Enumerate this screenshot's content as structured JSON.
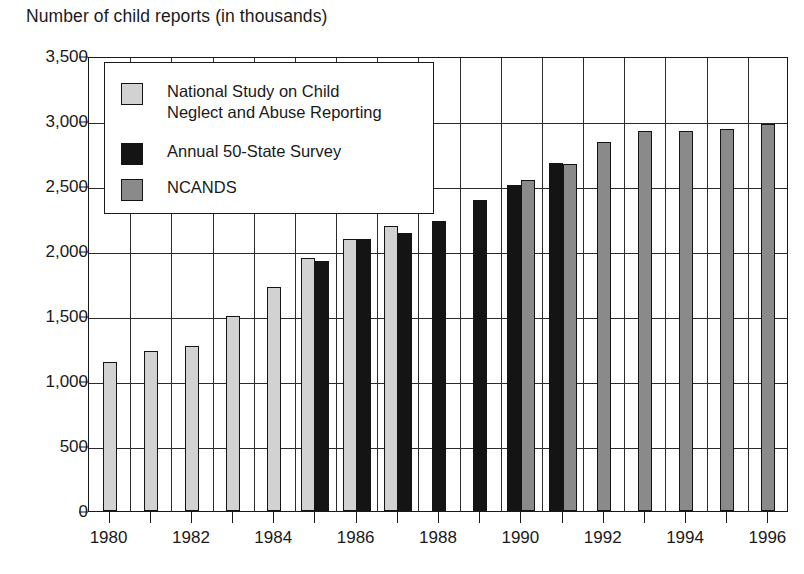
{
  "chart_data": {
    "type": "bar",
    "title": "Number of child reports (in thousands)",
    "xlabel": "",
    "ylabel": "",
    "ylim": [
      0,
      3500
    ],
    "ytick_step": 500,
    "grid": true,
    "legend_position": "upper-left-inside",
    "categories": [
      "1980",
      "1981",
      "1982",
      "1983",
      "1984",
      "1985",
      "1986",
      "1987",
      "1988",
      "1989",
      "1990",
      "1991",
      "1992",
      "1993",
      "1994",
      "1995",
      "1996"
    ],
    "x_tick_labels": [
      "1980",
      "1982",
      "1984",
      "1986",
      "1988",
      "1990",
      "1992",
      "1994",
      "1996"
    ],
    "y_tick_labels": [
      "0",
      "500",
      "1,000",
      "1,500",
      "2,000",
      "2,500",
      "3,000",
      "3,500"
    ],
    "y_tick_values": [
      0,
      500,
      1000,
      1500,
      2000,
      2500,
      3000,
      3500
    ],
    "series": [
      {
        "name": "National Study on Child Neglect and Abuse Reporting",
        "key": "national",
        "color": "#d2d2d2",
        "values": [
          1150,
          1230,
          1270,
          1500,
          1720,
          1950,
          2090,
          2190,
          null,
          null,
          null,
          null,
          null,
          null,
          null,
          null,
          null
        ]
      },
      {
        "name": "Annual 50-State Survey",
        "key": "annual",
        "color": "#141414",
        "values": [
          null,
          null,
          null,
          null,
          null,
          1920,
          2090,
          2140,
          2230,
          2390,
          2510,
          2680,
          null,
          null,
          null,
          null,
          null
        ]
      },
      {
        "name": "NCANDS",
        "key": "ncands",
        "color": "#8a8a8a",
        "values": [
          null,
          null,
          null,
          null,
          null,
          null,
          null,
          null,
          null,
          null,
          2550,
          2670,
          2840,
          2920,
          2920,
          2940,
          2980
        ]
      }
    ]
  },
  "legend": {
    "entries": [
      {
        "label": "National Study on Child\nNeglect and Abuse Reporting",
        "key": "national"
      },
      {
        "label": "Annual 50-State Survey",
        "key": "annual"
      },
      {
        "label": "NCANDS",
        "key": "ncands"
      }
    ]
  }
}
